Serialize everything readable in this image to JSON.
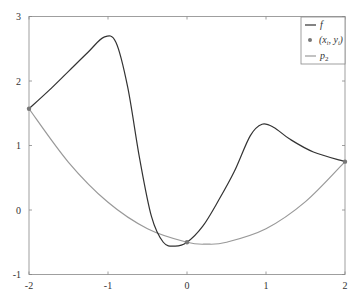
{
  "chart_data": {
    "type": "line",
    "title": "",
    "xlabel": "",
    "ylabel": "",
    "xlim": [
      -2,
      2
    ],
    "ylim": [
      -1,
      3
    ],
    "grid": false,
    "legend_position": "top-right",
    "x_ticks": [
      "-2",
      "-1",
      "0",
      "1",
      "2"
    ],
    "y_ticks": [
      "-1",
      "0",
      "1",
      "2",
      "3"
    ],
    "series": [
      {
        "name": "f",
        "color": "#333333",
        "x": [
          -2,
          -1.75,
          -1.5,
          -1.25,
          -1.05,
          -0.9,
          -0.75,
          -0.6,
          -0.45,
          -0.3,
          -0.15,
          0,
          0.2,
          0.4,
          0.6,
          0.8,
          0.95,
          1.1,
          1.3,
          1.6,
          2
        ],
        "y": [
          1.57,
          1.85,
          2.15,
          2.45,
          2.68,
          2.6,
          1.9,
          0.8,
          -0.1,
          -0.5,
          -0.56,
          -0.5,
          -0.25,
          0.15,
          0.6,
          1.15,
          1.33,
          1.28,
          1.1,
          0.9,
          0.75
        ]
      },
      {
        "name": "(x_i, y_i)",
        "color": "#777777",
        "marker": "dot",
        "x": [
          -2,
          0,
          2
        ],
        "y": [
          1.57,
          -0.5,
          0.75
        ]
      },
      {
        "name": "p_2",
        "color": "#999999",
        "x": [
          -2,
          -1.5,
          -1,
          -0.5,
          0,
          0.25,
          0.5,
          1,
          1.5,
          2
        ],
        "y": [
          1.57,
          0.74,
          0.12,
          -0.29,
          -0.5,
          -0.53,
          -0.5,
          -0.29,
          0.13,
          0.75
        ]
      }
    ]
  },
  "legend": {
    "f": "f",
    "points": "(x",
    "points_sub_i": "i",
    "points_mid": ", y",
    "points_end": ")",
    "p2": "p",
    "p2_sub": "2"
  }
}
